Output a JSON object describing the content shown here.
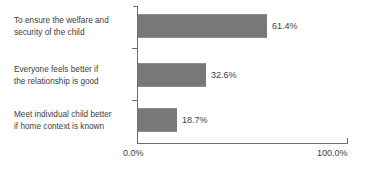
{
  "chart_data": {
    "type": "bar",
    "orientation": "horizontal",
    "title": "",
    "xlabel": "",
    "ylabel": "",
    "grid": false,
    "legend": null,
    "xlim": [
      0,
      100
    ],
    "xtick_labels": [
      "0.0%",
      "100.0%"
    ],
    "xticks": [
      0,
      100
    ],
    "categories": [
      "To ensure the welfare and security of the child",
      "Everyone feels better if the relationship is good",
      "Meet individual child better if home context is known"
    ],
    "category_lines": [
      [
        "To ensure the welfare and",
        "security of the child"
      ],
      [
        "Everyone feels better if",
        "the relationship is good"
      ],
      [
        "Meet individual child better",
        "if home context is known"
      ]
    ],
    "values": [
      61.4,
      32.6,
      18.7
    ],
    "value_labels": [
      "61.4%",
      "32.6%",
      "18.7%"
    ],
    "bar_color": "#787878",
    "axis_color": "#6e6e6e",
    "text_color": "#3d3d3d",
    "background_color": "#ffffff"
  }
}
